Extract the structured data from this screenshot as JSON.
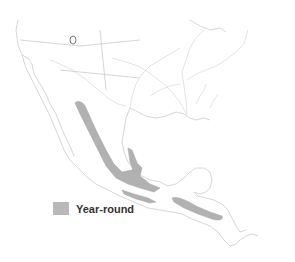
{
  "map": {
    "region": "Mexico and Central America with southern United States",
    "colors": {
      "background": "#ffffff",
      "borders": "#c8c8c8",
      "rivers": "#cfcfcf",
      "range_fill": "#a9a9a9"
    }
  },
  "legend": {
    "items": [
      {
        "label": "Year-round",
        "color": "#b8b8b8"
      }
    ]
  }
}
